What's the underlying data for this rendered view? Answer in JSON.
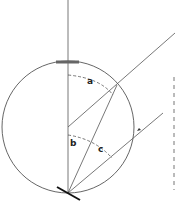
{
  "diagram": {
    "labels": {
      "a": "a",
      "b": "b",
      "c": "c"
    },
    "colors": {
      "stroke": "#444444",
      "dashed": "#555555",
      "mirror": "#111111",
      "background": "#ffffff"
    }
  }
}
